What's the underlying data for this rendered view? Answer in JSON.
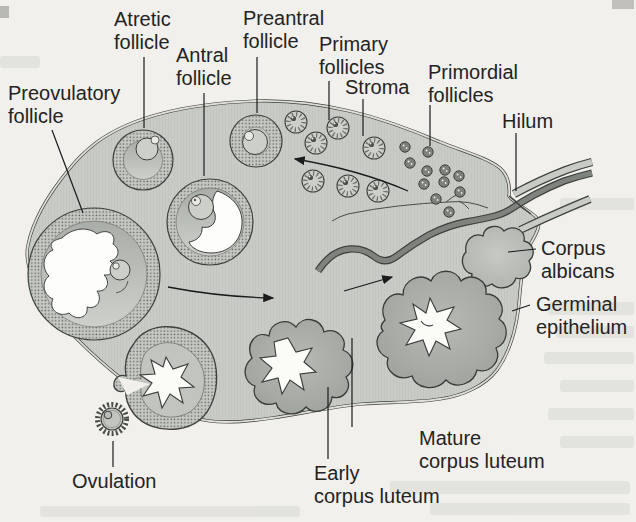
{
  "figure": {
    "type": "anatomical-diagram",
    "labels": {
      "preovulatory_follicle": {
        "line1": "Preovulatory",
        "line2": "follicle"
      },
      "atretic_follicle": {
        "line1": "Atretic",
        "line2": "follicle"
      },
      "antral_follicle": {
        "line1": "Antral",
        "line2": "follicle"
      },
      "preantral_follicle": {
        "line1": "Preantral",
        "line2": "follicle"
      },
      "primary_follicles": {
        "line1": "Primary",
        "line2": "follicles"
      },
      "stroma": {
        "line1": "Stroma"
      },
      "primordial_follicles": {
        "line1": "Primordial",
        "line2": "follicles"
      },
      "hilum": {
        "line1": "Hilum"
      },
      "corpus_albicans": {
        "line1": "Corpus",
        "line2": "albicans"
      },
      "germinal_epithelium": {
        "line1": "Germinal",
        "line2": "epithelium"
      },
      "ovulation": {
        "line1": "Ovulation"
      },
      "early_corpus_luteum": {
        "line1": "Early",
        "line2": "corpus luteum"
      },
      "mature_corpus_luteum": {
        "line1": "Mature",
        "line2": "corpus luteum"
      }
    },
    "colors": {
      "paper": "#f1f0ec",
      "stroma_fill": "#c9ccc6",
      "follicle_ring_base": "#c6c9c3",
      "stipple_dot": "#62655f",
      "interior_light": "#ced1cb",
      "interior_dark": "#a9ada7",
      "corpus_luteum": "#a9ada7",
      "vessel": "#7f837d",
      "outline": "#3c3f3b",
      "label_text": "#232323",
      "antrum": "#ffffff"
    },
    "counts": {
      "primary_follicles": 7,
      "primordial_follicles": 11
    }
  }
}
